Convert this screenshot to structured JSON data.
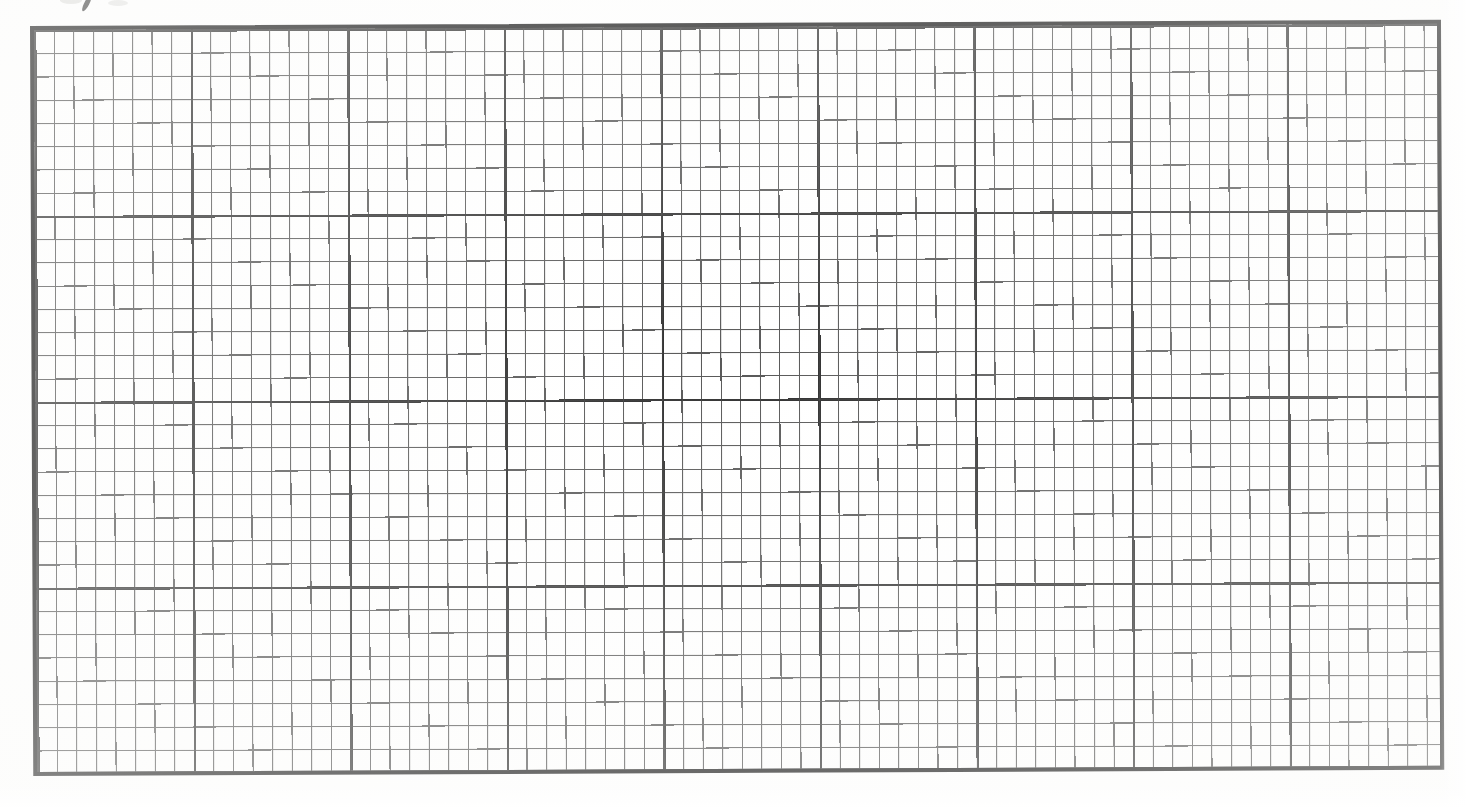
{
  "document": {
    "type": "scanned-graph-paper",
    "title": "Blank graph paper grid",
    "caption": ""
  },
  "chart_data": {
    "type": "table",
    "title": "",
    "subtitle": "",
    "xlabel": "",
    "ylabel": "",
    "categories": [],
    "values": [],
    "grid": "on",
    "legend_position": "none",
    "annotations": [],
    "description": "Empty scanned graph paper: rectangular ruled grid with no plotted data, no axis tick labels, no legend and no title text.",
    "major_columns": 9,
    "major_rows": 4,
    "minor_cells_per_major_x": 8,
    "minor_cells_per_major_y": 8,
    "total_minor_columns": 72,
    "total_minor_rows": 32
  },
  "grid": {
    "border_color": "#1c1c1c",
    "major_line_color": "#2e2e2e",
    "minor_line_color": "#585858",
    "background_color": "#ffffff",
    "major_line_width_px": 2.4,
    "minor_line_width_px": 1.1,
    "border_width_px": 4,
    "minor_cell_width_px": 19.57,
    "minor_cell_height_px": 23.24,
    "major_block_width_px": 156.55,
    "major_block_height_px": 185.9,
    "sheet_left_px": 31,
    "sheet_top_px": 27,
    "sheet_width_px": 1409,
    "sheet_height_px": 748,
    "rotation_deg": -0.25
  },
  "marks": {
    "top_edge_ink_mark": "partial-handwritten-stroke",
    "top_edge_ink_mark_x_px": 84,
    "top_edge_ink_mark_y_px": -4
  },
  "page": {
    "width_px": 1466,
    "height_px": 807,
    "paper_color": "#ffffff"
  }
}
